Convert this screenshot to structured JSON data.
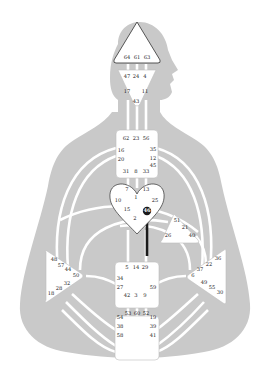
{
  "chart_type": "Human Design Bodygraph",
  "colors": {
    "silhouette": "#c9c9c9",
    "channel": "#ffffff",
    "center_fill": "#ffffff",
    "center_stroke": "#bdbdbd",
    "head_stroke": "#444444",
    "heart_stroke": "#444444",
    "defined_channel": "#1a1a1a",
    "active_gate": "#1a1a1a",
    "gate_text": "#222222"
  },
  "centers": {
    "head": {
      "name": "Head",
      "gates": [
        "64",
        "61",
        "63"
      ]
    },
    "ajna": {
      "name": "Ajna",
      "gates": [
        "47",
        "24",
        "4",
        "17",
        "11",
        "43"
      ]
    },
    "throat": {
      "name": "Throat",
      "gates": [
        "62",
        "23",
        "56",
        "16",
        "35",
        "20",
        "12",
        "45",
        "31",
        "8",
        "33"
      ]
    },
    "g": {
      "name": "G Center",
      "gates": [
        "7",
        "1",
        "13",
        "10",
        "25",
        "15",
        "46",
        "2"
      ]
    },
    "heart": {
      "name": "Heart / Ego",
      "gates": [
        "51",
        "21",
        "26",
        "40"
      ]
    },
    "spleen": {
      "name": "Spleen",
      "gates": [
        "48",
        "57",
        "44",
        "50",
        "32",
        "28",
        "18"
      ]
    },
    "solar_plexus": {
      "name": "Solar Plexus",
      "gates": [
        "36",
        "22",
        "37",
        "6",
        "49",
        "55",
        "30"
      ]
    },
    "sacral": {
      "name": "Sacral",
      "gates": [
        "5",
        "14",
        "29",
        "34",
        "27",
        "59",
        "42",
        "3",
        "9"
      ]
    },
    "root": {
      "name": "Root",
      "gates": [
        "53",
        "60",
        "52",
        "54",
        "19",
        "38",
        "39",
        "58",
        "41"
      ]
    }
  },
  "active_gates": [
    "46"
  ],
  "defined_channels": [
    {
      "from": "46",
      "to": "29",
      "label": "46-29"
    }
  ]
}
